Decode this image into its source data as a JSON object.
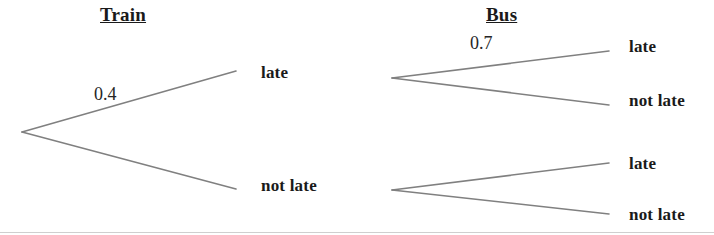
{
  "diagram": {
    "type": "probability-tree",
    "stages": [
      {
        "heading": "Train",
        "heading_pos": {
          "x": 100,
          "y": 5
        },
        "branches": [
          {
            "outcome_label": "late",
            "probability_label": "0.4",
            "probability_pos": {
              "x": 94,
              "y": 85
            },
            "outcome_pos": {
              "x": 261,
              "y": 64
            },
            "line": {
              "x1": 22,
              "y1": 132,
              "x2": 236,
              "y2": 71
            }
          },
          {
            "outcome_label": "not late",
            "probability_label": "",
            "outcome_pos": {
              "x": 261,
              "y": 177
            },
            "line": {
              "x1": 22,
              "y1": 132,
              "x2": 236,
              "y2": 189
            }
          }
        ]
      },
      {
        "heading": "Bus",
        "heading_pos": {
          "x": 486,
          "y": 5
        },
        "nodes": [
          {
            "vertex": {
              "x": 392,
              "y": 78
            },
            "branches": [
              {
                "outcome_label": "late",
                "probability_label": "0.7",
                "probability_pos": {
                  "x": 470,
                  "y": 34
                },
                "outcome_pos": {
                  "x": 629,
                  "y": 38
                },
                "line": {
                  "x1": 392,
                  "y1": 78,
                  "x2": 609,
                  "y2": 51
                }
              },
              {
                "outcome_label": "not late",
                "probability_label": "",
                "outcome_pos": {
                  "x": 629,
                  "y": 92
                },
                "line": {
                  "x1": 392,
                  "y1": 78,
                  "x2": 609,
                  "y2": 105
                }
              }
            ]
          },
          {
            "vertex": {
              "x": 392,
              "y": 190
            },
            "branches": [
              {
                "outcome_label": "late",
                "probability_label": "",
                "outcome_pos": {
                  "x": 629,
                  "y": 155
                },
                "line": {
                  "x1": 392,
                  "y1": 190,
                  "x2": 609,
                  "y2": 163
                }
              },
              {
                "outcome_label": "not late",
                "probability_label": "",
                "outcome_pos": {
                  "x": 629,
                  "y": 206
                },
                "line": {
                  "x1": 392,
                  "y1": 190,
                  "x2": 609,
                  "y2": 214
                }
              }
            ]
          }
        ]
      }
    ]
  },
  "labels": {
    "heading_train": "Train",
    "heading_bus": "Bus",
    "prob_train_late": "0.4",
    "prob_bus_late_upper": "0.7",
    "train_late": "late",
    "train_not_late": "not late",
    "bus_upper_late": "late",
    "bus_upper_not_late": "not late",
    "bus_lower_late": "late",
    "bus_lower_not_late": "not late"
  },
  "colors": {
    "line": "#808080",
    "text": "#1a1a1a",
    "background": "#ffffff",
    "rule": "#cfcfcf"
  }
}
